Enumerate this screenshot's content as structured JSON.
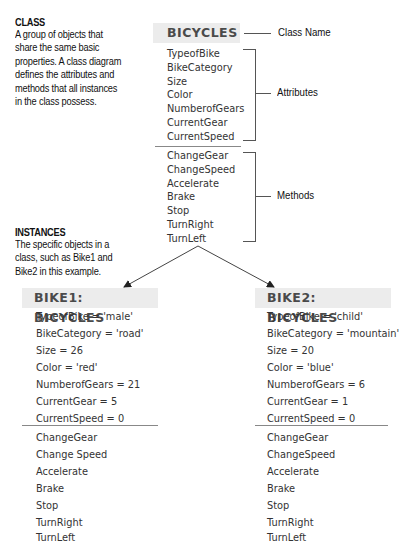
{
  "class_section": {
    "title": "CLASS",
    "description_lines": [
      "A group of objects that",
      "share the same basic",
      "properties.  A class diagram",
      "defines the attributes and",
      "methods that all instances",
      "in the class possess."
    ]
  },
  "instances_section": {
    "title": "INSTANCES",
    "description_lines": [
      "The specific objects in a",
      "class, such as Bike1 and",
      "Bike2 in this example."
    ]
  },
  "class_diagram": {
    "name": "BICYCLES",
    "attributes": [
      "TypeofBike",
      "BikeCategory",
      "Size",
      "Color",
      "NumberofGears",
      "CurrentGear",
      "CurrentSpeed"
    ],
    "methods": [
      "ChangeGear",
      "ChangeSpeed",
      "Accelerate",
      "Brake",
      "Stop",
      "TurnRight",
      "TurnLeft"
    ],
    "labels": {
      "class_name": "Class Name",
      "attributes": "Attributes",
      "methods": "Methods"
    }
  },
  "instances": [
    {
      "name": "BIKE1: BICYCLES",
      "attributes": [
        "TypeofBike = 'male'",
        "BikeCategory = 'road'",
        "Size = 26",
        "Color = 'red'",
        "NumberofGears = 21",
        "CurrentGear = 5",
        "CurrentSpeed = 0"
      ],
      "methods": [
        "ChangeGear",
        "Change Speed",
        "Accelerate",
        "Brake",
        "Stop",
        "TurnRight",
        "TurnLeft"
      ]
    },
    {
      "name": "BIKE2: BICYCLES",
      "attributes": [
        "TypeofBike = 'child'",
        "BikeCategory = 'mountain'",
        "Size = 20",
        "Color = 'blue'",
        "NumberofGears = 6",
        "CurrentGear = 1",
        "CurrentSpeed = 0"
      ],
      "methods": [
        "ChangeGear",
        "ChangeSpeed",
        "Accelerate",
        "Brake",
        "Stop",
        "TurnRight",
        "TurnLeft"
      ]
    }
  ],
  "colors": {
    "header_bg": "#ececec",
    "header_text": "#4a4a4a",
    "line": "#555555"
  }
}
